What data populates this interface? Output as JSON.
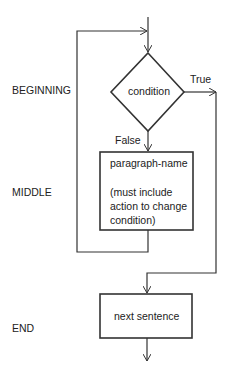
{
  "diagram": {
    "type": "flowchart",
    "section_labels": {
      "beginning": "BEGINNING",
      "middle": "MIDDLE",
      "end": "END"
    },
    "nodes": {
      "decision": {
        "shape": "diamond",
        "label": "condition"
      },
      "process": {
        "shape": "rectangle",
        "title": "paragraph-name",
        "note_lines": [
          "(must include",
          "action to change",
          "condition)"
        ]
      },
      "exit": {
        "shape": "rectangle",
        "label": "next sentence"
      }
    },
    "edge_labels": {
      "true": "True",
      "false": "False"
    },
    "colors": {
      "line": "#333333",
      "background": "#ffffff"
    }
  }
}
